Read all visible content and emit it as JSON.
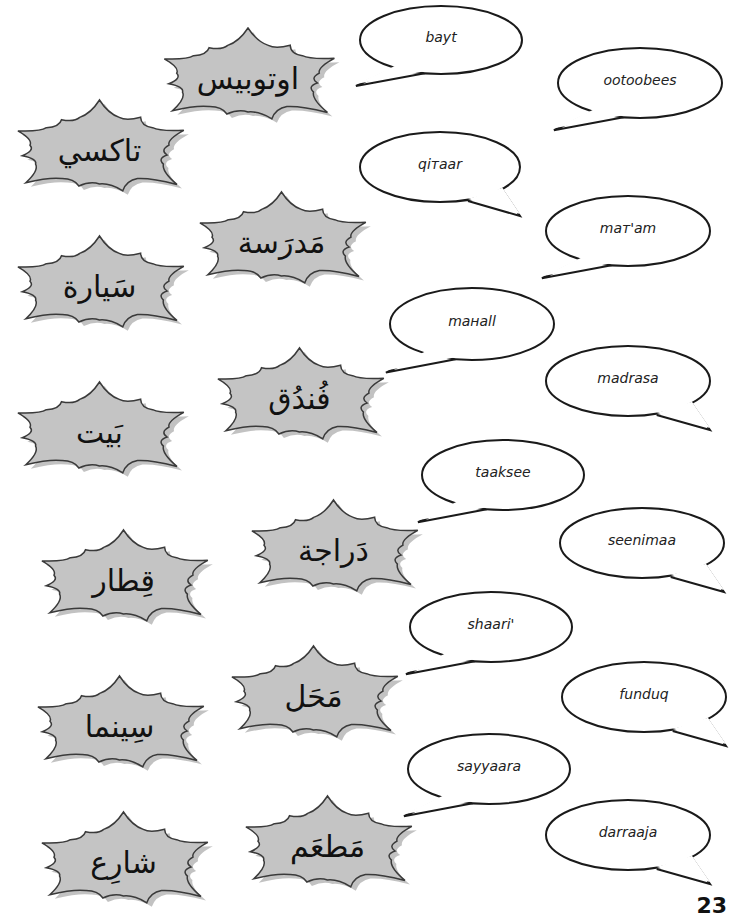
{
  "arabic_words": [
    {
      "id": "otobees",
      "text": "اوتوبيس",
      "x": 148,
      "y": 28,
      "w": 200,
      "h": 100
    },
    {
      "id": "taksee",
      "text": "تاكسي",
      "x": 2,
      "y": 100,
      "w": 195,
      "h": 100
    },
    {
      "id": "madrasa",
      "text": "مَدرَسة",
      "x": 184,
      "y": 192,
      "w": 195,
      "h": 100
    },
    {
      "id": "sayyara",
      "text": "سَيارة",
      "x": 2,
      "y": 236,
      "w": 195,
      "h": 100
    },
    {
      "id": "funduq",
      "text": "فُندُق",
      "x": 202,
      "y": 348,
      "w": 195,
      "h": 100
    },
    {
      "id": "bayt",
      "text": "بَيت",
      "x": 2,
      "y": 382,
      "w": 195,
      "h": 100
    },
    {
      "id": "darraaja",
      "text": "دَراجة",
      "x": 236,
      "y": 500,
      "w": 195,
      "h": 100
    },
    {
      "id": "qitaar",
      "text": "قِطار",
      "x": 26,
      "y": 530,
      "w": 195,
      "h": 100
    },
    {
      "id": "mahall",
      "text": "مَحَل",
      "x": 216,
      "y": 646,
      "w": 195,
      "h": 100
    },
    {
      "id": "seenimaa",
      "text": "سِينما",
      "x": 22,
      "y": 676,
      "w": 195,
      "h": 100
    },
    {
      "id": "mataam",
      "text": "مَطعَم",
      "x": 230,
      "y": 796,
      "w": 195,
      "h": 100
    },
    {
      "id": "shaari",
      "text": "شارِع",
      "x": 26,
      "y": 812,
      "w": 195,
      "h": 100
    }
  ],
  "transliterations": [
    {
      "id": "bayt",
      "text": "bayt",
      "x": 356,
      "y": 2,
      "w": 170,
      "h": 76,
      "tail": "left"
    },
    {
      "id": "ootoobees",
      "text": "ootoobees",
      "x": 554,
      "y": 44,
      "w": 172,
      "h": 78,
      "tail": "left"
    },
    {
      "id": "qitaar",
      "text": "qiтaar",
      "x": 356,
      "y": 128,
      "w": 168,
      "h": 78,
      "tail": "right"
    },
    {
      "id": "mataam",
      "text": "maт'am",
      "x": 542,
      "y": 192,
      "w": 172,
      "h": 78,
      "tail": "left"
    },
    {
      "id": "mahall",
      "text": "maнall",
      "x": 386,
      "y": 284,
      "w": 172,
      "h": 80,
      "tail": "left"
    },
    {
      "id": "madrasa",
      "text": "madrasa",
      "x": 542,
      "y": 342,
      "w": 172,
      "h": 78,
      "tail": "right"
    },
    {
      "id": "taksee",
      "text": "taaksee",
      "x": 418,
      "y": 436,
      "w": 170,
      "h": 78,
      "tail": "left"
    },
    {
      "id": "seenimaa",
      "text": "seenimaa",
      "x": 556,
      "y": 504,
      "w": 172,
      "h": 78,
      "tail": "right"
    },
    {
      "id": "shaari",
      "text": "shaari'",
      "x": 406,
      "y": 588,
      "w": 170,
      "h": 78,
      "tail": "left"
    },
    {
      "id": "funduq",
      "text": "funduq",
      "x": 558,
      "y": 658,
      "w": 172,
      "h": 78,
      "tail": "right"
    },
    {
      "id": "sayyaara",
      "text": "sayyaara",
      "x": 404,
      "y": 730,
      "w": 170,
      "h": 78,
      "tail": "left"
    },
    {
      "id": "darraaja",
      "text": "darraaja",
      "x": 542,
      "y": 796,
      "w": 172,
      "h": 78,
      "tail": "right"
    }
  ],
  "page_number": "23",
  "colors": {
    "burst_fill": "#c4c4c4",
    "burst_stroke": "#3a3a3a",
    "burst_shadow": "#9a9a9a",
    "bubble_stroke": "#1a1a1a"
  }
}
